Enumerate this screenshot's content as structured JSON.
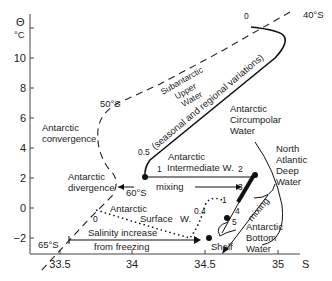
{
  "axes": {
    "y_symbol": "Θ",
    "y_unit": "°C",
    "x_symbol": "S",
    "y_ticks": [
      "10",
      "8",
      "6",
      "4",
      "2",
      "0",
      "−2"
    ],
    "x_ticks": [
      "33.5",
      "34",
      "34.5",
      "35"
    ]
  },
  "labels": {
    "subantarctic_1": "Subantarctic",
    "subantarctic_2": "Upper",
    "subantarctic_3": "Water",
    "seasonal": "(seasonal and regional variations)",
    "lat_40": "40°S",
    "lat_50": "50°S",
    "lat_60": "60°S",
    "lat_65": "65°S",
    "zero_top": "0",
    "zero_bottom": "0",
    "conv_1": "Antarctic",
    "conv_2": "convergence",
    "div_1": "Antarctic",
    "div_2": "divergence",
    "acw_1": "Antarctic",
    "acw_2": "Circumpolar",
    "acw_3": "Water",
    "aiw_1": "Antarctic",
    "aiw_2": "Intermediate W.",
    "nadw_1": "North",
    "nadw_2": "Atlantic",
    "nadw_3": "Deep",
    "nadw_4": "Water",
    "mixing_h": "mixing",
    "mixing_d": "mixing",
    "asw_1": "Antarctic",
    "asw_2": "Surface",
    "asw_3": "W.",
    "sal_1": "Salinity increase",
    "sal_2": "from freezing",
    "shelf": "Shelf",
    "abw_1": "Antarctic",
    "abw_2": "Bottom",
    "abw_3": "Water",
    "n05": "0.5",
    "n04": "0.4",
    "n1a": "1",
    "n1b": "1",
    "n2": "2",
    "n3": "3",
    "n4": "4",
    "n5": "5"
  }
}
